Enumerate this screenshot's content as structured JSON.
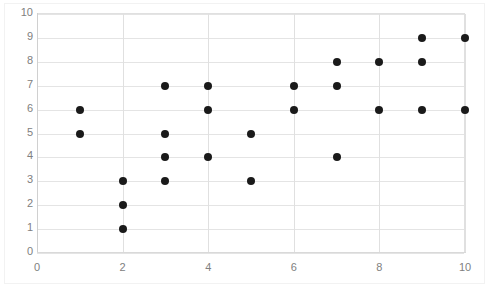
{
  "chart_data": {
    "type": "scatter",
    "title": "",
    "subtitle": "",
    "xlabel": "",
    "ylabel": "",
    "xlim": [
      0,
      10
    ],
    "ylim": [
      0,
      10
    ],
    "x_ticks": [
      "0",
      "2",
      "4",
      "6",
      "8",
      "10"
    ],
    "x_tick_values": [
      0,
      2,
      4,
      6,
      8,
      10
    ],
    "y_ticks": [
      "0",
      "1",
      "2",
      "3",
      "4",
      "5",
      "6",
      "7",
      "8",
      "9",
      "10"
    ],
    "y_tick_values": [
      0,
      1,
      2,
      3,
      4,
      5,
      6,
      7,
      8,
      9,
      10
    ],
    "grid": {
      "horizontal": true,
      "vertical": true
    },
    "legend": {
      "visible": false,
      "position": "none",
      "entries": []
    },
    "annotations": [],
    "marker": {
      "shape": "circle",
      "color": "#1a1a1a",
      "size_px": 8
    },
    "series": [
      {
        "name": "Series 1",
        "points": [
          [
            1,
            6
          ],
          [
            1,
            5
          ],
          [
            2,
            3
          ],
          [
            2,
            2
          ],
          [
            2,
            1
          ],
          [
            3,
            7
          ],
          [
            3,
            5
          ],
          [
            3,
            4
          ],
          [
            3,
            3
          ],
          [
            4,
            7
          ],
          [
            4,
            6
          ],
          [
            4,
            4
          ],
          [
            5,
            5
          ],
          [
            5,
            3
          ],
          [
            6,
            7
          ],
          [
            6,
            6
          ],
          [
            7,
            8
          ],
          [
            7,
            7
          ],
          [
            7,
            4
          ],
          [
            8,
            8
          ],
          [
            8,
            6
          ],
          [
            9,
            9
          ],
          [
            9,
            8
          ],
          [
            9,
            6
          ],
          [
            10,
            9
          ],
          [
            10,
            6
          ]
        ]
      }
    ],
    "point_count": 26
  },
  "style": {
    "background": "#ffffff",
    "grid_color": "#e4e4e4",
    "axis_color": "#d9d9d9",
    "tick_label_color": "#808080",
    "marker_color": "#1a1a1a"
  }
}
